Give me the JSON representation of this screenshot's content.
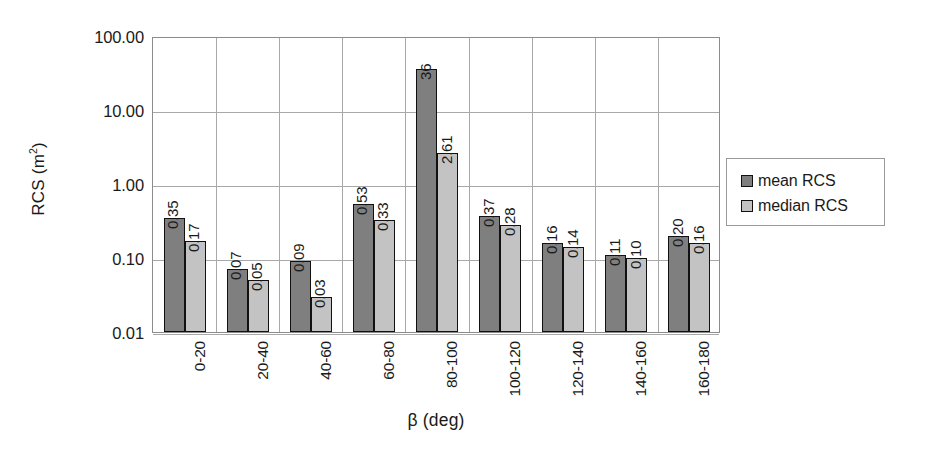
{
  "chart_data": {
    "type": "bar",
    "title": "",
    "xlabel": "β (deg)",
    "ylabel": "RCS (m²)",
    "yscale": "log",
    "ylim": [
      0.01,
      100
    ],
    "ytick_labels": [
      "100.00",
      "10.00",
      "1.00",
      "0.10",
      "0.01"
    ],
    "ytick_values": [
      100,
      10,
      1,
      0.1,
      0.01
    ],
    "grid": "horizontal-and-vertical",
    "legend_position": "right",
    "categories": [
      "0-20",
      "20-40",
      "40-60",
      "60-80",
      "80-100",
      "100-120",
      "120-140",
      "140-160",
      "160-180"
    ],
    "series": [
      {
        "name": "mean RCS",
        "color": "#7f7f7f",
        "values": [
          0.35,
          0.07,
          0.09,
          0.53,
          36,
          0.37,
          0.16,
          0.11,
          0.2
        ],
        "labels": [
          "0.35",
          "0.07",
          "0.09",
          "0.53",
          "36",
          "0.37",
          "0.16",
          "0.11",
          "0.20"
        ]
      },
      {
        "name": "median RCS",
        "color": "#c3c3c3",
        "values": [
          0.17,
          0.05,
          0.03,
          0.33,
          2.61,
          0.28,
          0.14,
          0.1,
          0.16
        ],
        "labels": [
          "0.17",
          "0.05",
          "0.03",
          "0.33",
          "2.61",
          "0.28",
          "0.14",
          "0.10",
          "0.16"
        ]
      }
    ]
  },
  "legend": {
    "items": [
      {
        "label": "mean RCS",
        "color": "#7f7f7f"
      },
      {
        "label": "median RCS",
        "color": "#c3c3c3"
      }
    ]
  },
  "axis": {
    "y_title_main": "RCS (m",
    "y_title_sup": "2",
    "y_title_tail": ")",
    "x_title": "β (deg)"
  }
}
